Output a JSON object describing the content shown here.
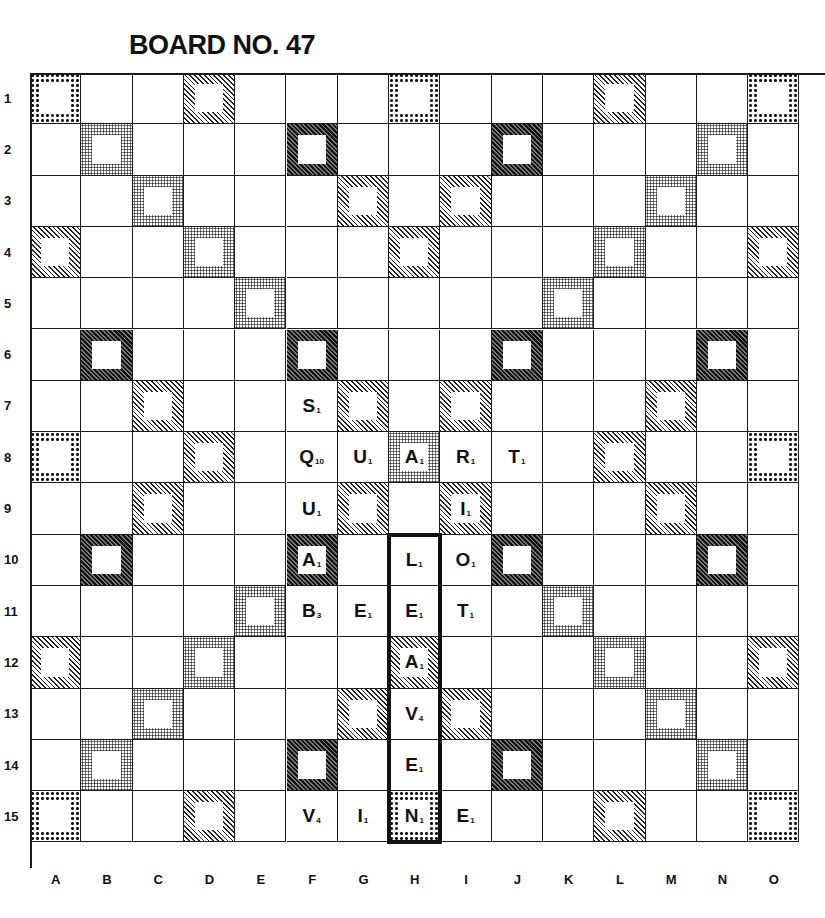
{
  "title": "BOARD NO. 47",
  "board": {
    "size": 15,
    "columns": [
      "A",
      "B",
      "C",
      "D",
      "E",
      "F",
      "G",
      "H",
      "I",
      "J",
      "K",
      "L",
      "M",
      "N",
      "O"
    ],
    "rows": [
      "1",
      "2",
      "3",
      "4",
      "5",
      "6",
      "7",
      "8",
      "9",
      "10",
      "11",
      "12",
      "13",
      "14",
      "15"
    ],
    "legend": {
      "tw": "coarse-dot pattern (triple word)",
      "dw": "fine-dot pattern (double word)",
      "dl": "light diagonal hatch (double letter)",
      "tl": "dark diagonal hatch (triple letter)"
    },
    "premium_rows": [
      "T..d...T...d..T",
      ".D...t...t...D.",
      "..D...d.d...D..",
      "d..D...d...D..d",
      "....D.....D....",
      ".t...t...t...t.",
      "..d...d.d...d..",
      "T..d...D...d..T",
      "..d...d.d...d..",
      ".t...t...t...t.",
      "....D.....D....",
      "d..D...d...D..d",
      "..D...d.d...D..",
      ".D...t...t...D.",
      "T..d...T...d..T"
    ],
    "tiles": [
      {
        "row": 7,
        "col": "F",
        "letter": "S",
        "value": "1"
      },
      {
        "row": 8,
        "col": "F",
        "letter": "Q",
        "value": "10"
      },
      {
        "row": 8,
        "col": "G",
        "letter": "U",
        "value": "1"
      },
      {
        "row": 8,
        "col": "H",
        "letter": "A",
        "value": "1"
      },
      {
        "row": 8,
        "col": "I",
        "letter": "R",
        "value": "1"
      },
      {
        "row": 8,
        "col": "J",
        "letter": "T",
        "value": "1"
      },
      {
        "row": 9,
        "col": "F",
        "letter": "U",
        "value": "1"
      },
      {
        "row": 9,
        "col": "I",
        "letter": "I",
        "value": "1"
      },
      {
        "row": 10,
        "col": "F",
        "letter": "A",
        "value": "1"
      },
      {
        "row": 10,
        "col": "H",
        "letter": "L",
        "value": "1"
      },
      {
        "row": 10,
        "col": "I",
        "letter": "O",
        "value": "1"
      },
      {
        "row": 11,
        "col": "F",
        "letter": "B",
        "value": "3"
      },
      {
        "row": 11,
        "col": "G",
        "letter": "E",
        "value": "1"
      },
      {
        "row": 11,
        "col": "H",
        "letter": "E",
        "value": "1"
      },
      {
        "row": 11,
        "col": "I",
        "letter": "T",
        "value": "1"
      },
      {
        "row": 12,
        "col": "H",
        "letter": "A",
        "value": "1"
      },
      {
        "row": 13,
        "col": "H",
        "letter": "V",
        "value": "4"
      },
      {
        "row": 14,
        "col": "H",
        "letter": "E",
        "value": "1"
      },
      {
        "row": 15,
        "col": "F",
        "letter": "V",
        "value": "4"
      },
      {
        "row": 15,
        "col": "G",
        "letter": "I",
        "value": "1"
      },
      {
        "row": 15,
        "col": "H",
        "letter": "N",
        "value": "1"
      },
      {
        "row": 15,
        "col": "I",
        "letter": "E",
        "value": "1"
      }
    ],
    "highlight": {
      "col": "H",
      "row_start": 10,
      "row_end": 15,
      "word": "LEAVEN"
    }
  }
}
